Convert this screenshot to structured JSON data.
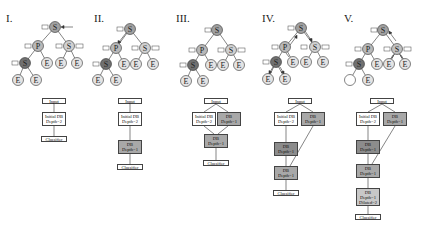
{
  "panels": [
    {
      "label": "I.",
      "boxes": [
        {
          "text": "Input",
          "fill": "#ffffff"
        },
        {
          "text": "Initial DB\nDepth=2",
          "fill": "#ffffff"
        },
        {
          "text": "Classifier",
          "fill": "#ffffff"
        }
      ]
    },
    {
      "label": "II.",
      "boxes": [
        {
          "text": "Input",
          "fill": "#ffffff"
        },
        {
          "text": "Initial DB\nDepth=2",
          "fill": "#ffffff"
        },
        {
          "text": "DB\nDepth=1",
          "fill": "#a8a8a8"
        },
        {
          "text": "Classifier",
          "fill": "#ffffff"
        }
      ]
    },
    {
      "label": "III.",
      "boxes": [
        {
          "text": "Input",
          "fill": "#ffffff"
        },
        {
          "text": "Initial DB\nDepth=2",
          "fill": "#ffffff"
        },
        {
          "text": "DB\nDepth=1",
          "fill": "#a8a8a8"
        },
        {
          "text": "DB\nDepth=1",
          "fill": "#a8a8a8"
        },
        {
          "text": "Classifier",
          "fill": "#ffffff"
        }
      ]
    },
    {
      "label": "IV.",
      "boxes": [
        {
          "text": "Input",
          "fill": "#ffffff"
        },
        {
          "text": "Initial DB\nDepth=2",
          "fill": "#ffffff"
        },
        {
          "text": "DB\nDepth=1",
          "fill": "#a8a8a8"
        },
        {
          "text": "DB\nDepth=1",
          "fill": "#8c8c8c"
        },
        {
          "text": "DB\nDepth=1",
          "fill": "#a8a8a8"
        },
        {
          "text": "Classifier",
          "fill": "#ffffff"
        }
      ]
    },
    {
      "label": "V.",
      "boxes": [
        {
          "text": "Input",
          "fill": "#ffffff"
        },
        {
          "text": "Initial DB\nDepth=2",
          "fill": "#ffffff"
        },
        {
          "text": "DB\nDepth=1",
          "fill": "#a8a8a8"
        },
        {
          "text": "DB\nDepth=1",
          "fill": "#8c8c8c"
        },
        {
          "text": "DB\nDepth=1",
          "fill": "#a8a8a8"
        },
        {
          "text": "DB\nDepth=1\nDilated=2",
          "fill": "#c8c8c8"
        },
        {
          "text": "Classifier",
          "fill": "#ffffff"
        }
      ]
    }
  ],
  "tree": {
    "root": "S",
    "level1": [
      "P",
      "S"
    ],
    "level2": [
      "S",
      "E",
      "E",
      "E"
    ],
    "level3": [
      "E",
      "E"
    ],
    "side_label": "D",
    "side_label_right": "D,1"
  }
}
